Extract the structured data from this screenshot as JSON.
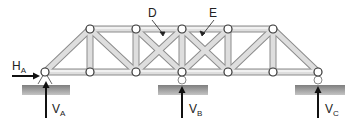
{
  "diagram": {
    "type": "truss",
    "member_labels": [
      {
        "id": "D",
        "text": "D",
        "x": 155,
        "y": 16
      },
      {
        "id": "E",
        "text": "E",
        "x": 213,
        "y": 16
      }
    ],
    "reactions": [
      {
        "id": "HA",
        "main": "H",
        "sub": "A",
        "direction": "right"
      },
      {
        "id": "VA",
        "main": "V",
        "sub": "A",
        "direction": "up"
      },
      {
        "id": "VB",
        "main": "V",
        "sub": "B",
        "direction": "up"
      },
      {
        "id": "VC",
        "main": "V",
        "sub": "C",
        "direction": "up"
      }
    ],
    "supports": [
      {
        "id": "A",
        "kind": "pin"
      },
      {
        "id": "B",
        "kind": "roller"
      },
      {
        "id": "C",
        "kind": "roller"
      }
    ],
    "colors": {
      "member": "#c8c8c8",
      "member_edge": "#8a8a8a",
      "ground": "#9a9a9a",
      "arrow": "#111111",
      "joint_fill": "#ffffff",
      "joint_stroke": "#333333"
    }
  }
}
